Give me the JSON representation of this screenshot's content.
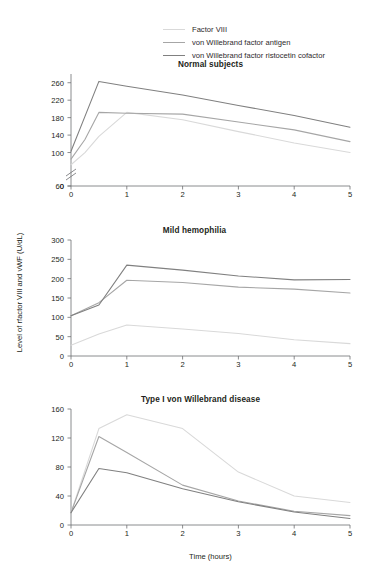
{
  "legend": {
    "items": [
      {
        "label": "Factor VIII",
        "color": "#d9d9d9"
      },
      {
        "label": "von Willebrand factor antigen",
        "color": "#a6a6a6"
      },
      {
        "label": "von Willebrand factor ristocetin cofactor",
        "color": "#808080"
      }
    ]
  },
  "axis_titles": {
    "x": "Time (hours)",
    "y": "Level of rfactor VIII and vWF (U/dL)"
  },
  "chart_data": [
    {
      "type": "line",
      "title": "Normal subjects",
      "xlabel": "",
      "ylabel": "",
      "xlim": [
        0,
        5
      ],
      "ylim": [
        0,
        280
      ],
      "yticks": [
        0,
        60,
        100,
        140,
        180,
        220,
        260
      ],
      "xticks": [
        0,
        1,
        2,
        3,
        4,
        5
      ],
      "axis_break": true,
      "grid": false,
      "legend_position": "top-center",
      "x": [
        0,
        0.25,
        0.5,
        1,
        2,
        3,
        4,
        5
      ],
      "series": [
        {
          "name": "Factor VIII",
          "color": "#d9d9d9",
          "values": [
            72,
            100,
            137,
            192,
            175,
            148,
            122,
            100
          ]
        },
        {
          "name": "von Willebrand factor antigen",
          "color": "#a6a6a6",
          "values": [
            85,
            130,
            192,
            190,
            188,
            170,
            152,
            125
          ]
        },
        {
          "name": "von Willebrand factor ristocetin cofactor",
          "color": "#808080",
          "values": [
            103,
            183,
            263,
            252,
            232,
            208,
            185,
            158
          ]
        }
      ]
    },
    {
      "type": "line",
      "title": "Mild hemophilia",
      "xlabel": "",
      "ylabel": "",
      "xlim": [
        0,
        5
      ],
      "ylim": [
        0,
        300
      ],
      "yticks": [
        0,
        50,
        100,
        150,
        200,
        250,
        300
      ],
      "xticks": [
        0,
        1,
        2,
        3,
        4,
        5
      ],
      "axis_break": false,
      "grid": false,
      "x": [
        0,
        0.5,
        1,
        2,
        3,
        4,
        5
      ],
      "series": [
        {
          "name": "Factor VIII",
          "color": "#d9d9d9",
          "values": [
            28,
            57,
            80,
            70,
            58,
            42,
            32
          ]
        },
        {
          "name": "von Willebrand factor antigen",
          "color": "#a6a6a6",
          "values": [
            104,
            138,
            196,
            190,
            178,
            173,
            163
          ]
        },
        {
          "name": "von Willebrand factor ristocetin cofactor",
          "color": "#808080",
          "values": [
            104,
            132,
            235,
            222,
            207,
            197,
            198
          ]
        }
      ]
    },
    {
      "type": "line",
      "title": "Type I von Willebrand disease",
      "xlabel": "Time (hours)",
      "ylabel": "",
      "xlim": [
        0,
        5
      ],
      "ylim": [
        0,
        160
      ],
      "yticks": [
        0,
        40,
        80,
        120,
        160
      ],
      "xticks": [
        0,
        1,
        2,
        3,
        4,
        5
      ],
      "axis_break": false,
      "grid": false,
      "x": [
        0,
        0.5,
        1,
        2,
        3,
        4,
        5
      ],
      "series": [
        {
          "name": "Factor VIII",
          "color": "#d9d9d9",
          "values": [
            17,
            133,
            152,
            133,
            73,
            40,
            31
          ]
        },
        {
          "name": "von Willebrand factor antigen",
          "color": "#a6a6a6",
          "values": [
            17,
            122,
            100,
            55,
            33,
            19,
            13
          ]
        },
        {
          "name": "von Willebrand factor ristocetin cofactor",
          "color": "#808080",
          "values": [
            17,
            78,
            72,
            50,
            32,
            18,
            9
          ]
        }
      ]
    }
  ]
}
